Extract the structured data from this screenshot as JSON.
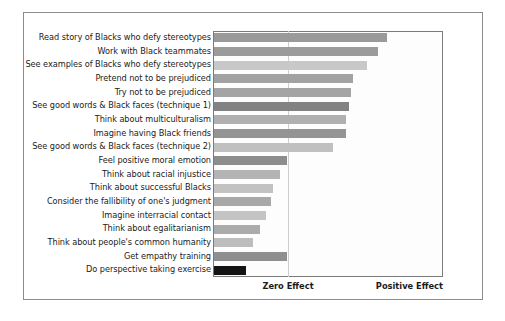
{
  "chart_data": {
    "type": "bar",
    "orientation": "horizontal",
    "title": "",
    "subtitle": "",
    "xlabel": "",
    "ylabel": "",
    "grid": true,
    "legend": null,
    "legend_position": "none",
    "axis_tick_labels": [
      "Zero Effect",
      "Positive Effect"
    ],
    "xlim": [
      0,
      100
    ],
    "x_zero_effect_value": 34,
    "x_positive_effect_value": 100,
    "note": "Bar lengths are relative effect sizes measured from the left edge of the plot; the 'Zero Effect' gridline sits at value 34 and 'Positive Effect' marks the right edge at value 100.",
    "categories": [
      "Read story of Blacks who defy stereotypes",
      "Work with Black teammates",
      "See examples of Blacks who defy stereotypes",
      "Pretend not to be prejudiced",
      "Try not to be prejudiced",
      "See good words & Black faces (technique 1)",
      "Think about multiculturalism",
      "Imagine having Black friends",
      "See good words & Black faces (technique 2)",
      "Feel positive moral emotion",
      "Think about racial injustice",
      "Think about successful Blacks",
      "Consider the fallibility of one's judgment",
      "Imagine interracial contact",
      "Think about egalitarianism",
      "Think about people's common humanity",
      "Get empathy training",
      "Do perspective taking exercise"
    ],
    "values": [
      76,
      72,
      67,
      61,
      60,
      59,
      58,
      58,
      52,
      32,
      29,
      26,
      25,
      23,
      20,
      17,
      32,
      14
    ],
    "bar_colors": [
      "#9a9a9a",
      "#9b9b9b",
      "#c8c8c8",
      "#a2a2a2",
      "#a4a4a4",
      "#828282",
      "#b0b0b0",
      "#949494",
      "#c0c0c0",
      "#8d8d8d",
      "#b4b4b4",
      "#c2c2c2",
      "#a8a8a8",
      "#c4c4c4",
      "#ababab",
      "#bdbdbd",
      "#8f8f8f",
      "#141414"
    ]
  },
  "axis": {
    "zero_effect_label": "Zero Effect",
    "positive_effect_label": "Positive Effect"
  },
  "style": {
    "frame_color": "#8c8c8c",
    "plot_border_color": "#7a7a7a",
    "gridline_color": "#cdcdcd",
    "background": "#ffffff",
    "text_color": "#1b1b1b"
  }
}
